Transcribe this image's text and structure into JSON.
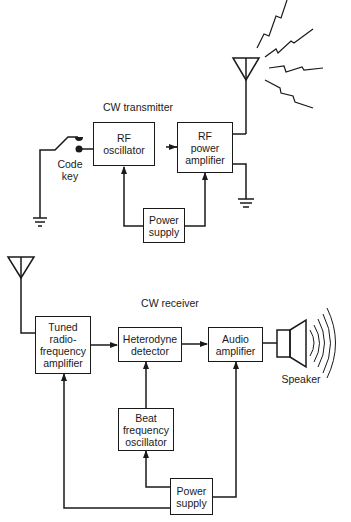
{
  "transmitter": {
    "title": "CW transmitter",
    "code_key": "Code key",
    "code_key_line1": "Code",
    "code_key_line2": "key",
    "rf_oscillator": {
      "line1": "RF",
      "line2": "oscillator"
    },
    "rf_power_amplifier": {
      "line1": "RF",
      "line2": "power",
      "line3": "amplifier"
    },
    "power_supply": {
      "line1": "Power",
      "line2": "supply"
    }
  },
  "receiver": {
    "title": "CW receiver",
    "tuned_rf_amplifier": {
      "line1": "Tuned",
      "line2": "radio-",
      "line3": "frequency",
      "line4": "amplifier"
    },
    "heterodyne_detector": {
      "line1": "Heterodyne",
      "line2": "detector"
    },
    "audio_amplifier": {
      "line1": "Audio",
      "line2": "amplifier"
    },
    "beat_frequency_oscillator": {
      "line1": "Beat",
      "line2": "frequency",
      "line3": "oscillator"
    },
    "power_supply": {
      "line1": "Power",
      "line2": "supply"
    },
    "speaker": "Speaker"
  }
}
